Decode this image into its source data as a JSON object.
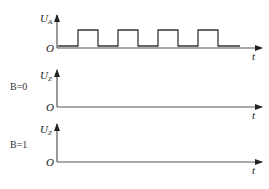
{
  "diagram": {
    "top": {
      "y_label": "U",
      "y_sub": "A",
      "origin": "O",
      "x_label": "t",
      "waveform": {
        "low_y": 46,
        "high_y": 30,
        "start_x": 58,
        "end_x": 240,
        "pulses": [
          [
            78,
            98
          ],
          [
            118,
            138
          ],
          [
            158,
            178
          ],
          [
            198,
            218
          ]
        ]
      }
    },
    "middle": {
      "condition": "B=0",
      "y_label": "U",
      "y_sub": "Z",
      "origin": "O",
      "x_label": "t"
    },
    "bottom": {
      "condition": "B=1",
      "y_label": "U",
      "y_sub": "Z",
      "origin": "O",
      "x_label": "t"
    }
  }
}
